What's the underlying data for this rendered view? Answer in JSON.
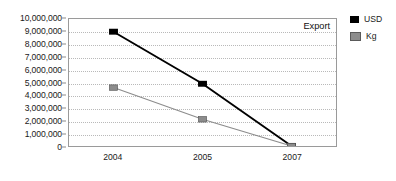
{
  "chart_data": {
    "type": "line",
    "title": "",
    "annotation": "Export",
    "xlabel": "",
    "ylabel": "",
    "categories": [
      "2004",
      "2005",
      "2007"
    ],
    "series": [
      {
        "name": "USD",
        "color": "#000000",
        "marker": "square",
        "values": [
          9000000,
          4900000,
          0
        ]
      },
      {
        "name": "Kg",
        "color": "#8c8c8c",
        "marker": "square",
        "values": [
          4600000,
          2100000,
          0
        ]
      }
    ],
    "ylim": [
      0,
      10000000
    ],
    "ytick_step": 1000000,
    "ytick_labels": [
      "10,000,000",
      "9,000,000",
      "8,000,000",
      "7,000,000",
      "6,000,000",
      "5,000,000",
      "4,000,000",
      "3,000,000",
      "2,000,000",
      "1,000,000",
      "0"
    ],
    "ytick_values": [
      10000000,
      9000000,
      8000000,
      7000000,
      6000000,
      5000000,
      4000000,
      3000000,
      2000000,
      1000000,
      0
    ],
    "grid": {
      "horizontal": true,
      "vertical": false,
      "style": "dotted",
      "color": "#b9b9b9"
    },
    "legend": {
      "position": "right",
      "entries": [
        {
          "label": "USD",
          "color": "#000000"
        },
        {
          "label": "Kg",
          "color": "#8c8c8c"
        }
      ]
    },
    "plot_border_color": "#9a9a9a",
    "background": "#ffffff"
  }
}
